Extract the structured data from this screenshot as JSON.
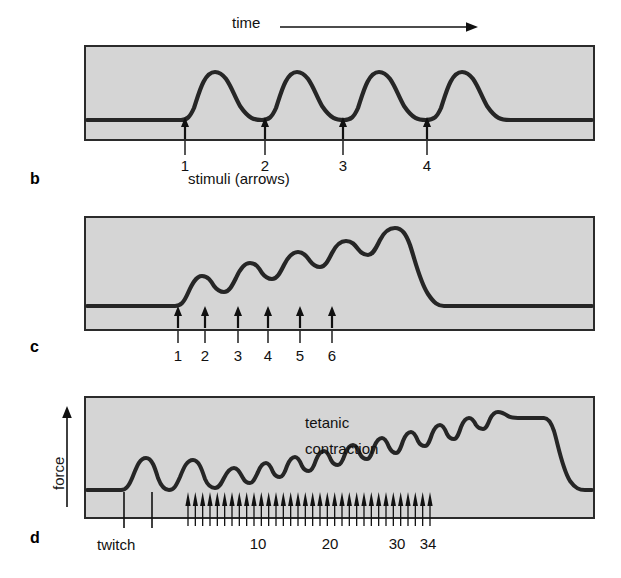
{
  "figure": {
    "title": "",
    "axis_time_label": "time",
    "axis_force_label": "force",
    "stimuli_caption": "stimuli (arrows)",
    "tetanic_label_line1": "tetanic",
    "tetanic_label_line2": "contraction",
    "twitch_label": "twitch",
    "panel_letters": {
      "b": "b",
      "c": "c",
      "d": "d"
    },
    "colors": {
      "panel_fill": "#d5d5d5",
      "panel_border": "#2b2b2b",
      "trace": "#262626",
      "text": "#111111",
      "background": "#ffffff"
    }
  },
  "chart_data": [
    {
      "type": "line",
      "panel": "b",
      "title": "Separate twitches — no summation",
      "xlabel": "time",
      "ylabel": "force",
      "grid": false,
      "legend": null,
      "stimulus_labels": [
        "1",
        "2",
        "3",
        "4"
      ],
      "stimulus_x": [
        185,
        265,
        343,
        427
      ],
      "stimulus_count": 4,
      "description": "Four equal-amplitude twitches; each returns to baseline before the next stimulus.",
      "x": [
        85,
        180,
        190,
        205,
        222,
        240,
        255,
        265,
        272,
        285,
        300,
        318,
        333,
        343,
        350,
        363,
        378,
        396,
        412,
        427,
        434,
        447,
        462,
        478,
        492,
        594
      ],
      "y": [
        0,
        0,
        10,
        38,
        55,
        55,
        30,
        0,
        10,
        38,
        55,
        55,
        30,
        0,
        10,
        38,
        55,
        55,
        30,
        0,
        10,
        38,
        55,
        50,
        0,
        0
      ],
      "ylim": [
        0,
        70
      ],
      "peak_amplitude": 55,
      "baseline": 0
    },
    {
      "type": "line",
      "panel": "c",
      "title": "Wave summation (incomplete tetanus)",
      "xlabel": "time",
      "ylabel": "force",
      "grid": false,
      "legend": null,
      "stimulus_labels": [
        "1",
        "2",
        "3",
        "4",
        "5",
        "6"
      ],
      "stimulus_x": [
        178,
        205,
        238,
        268,
        300,
        332
      ],
      "stimulus_count": 6,
      "description": "Six stimuli at increasing frequency; each contraction begins before full relaxation, so peaks climb in a staircase.",
      "peak_values": [
        30,
        40,
        50,
        58,
        66,
        78
      ],
      "trough_values": [
        22,
        33,
        43,
        52,
        60
      ],
      "ylim": [
        0,
        90
      ],
      "baseline": 0
    },
    {
      "type": "line",
      "panel": "d",
      "title": "Tetanic contraction",
      "xlabel": "stimulus number",
      "ylabel": "force",
      "grid": false,
      "legend": null,
      "tick_labels": [
        "10",
        "20",
        "30",
        "34"
      ],
      "tick_x": [
        258,
        330,
        397,
        428
      ],
      "twitch_marks_x": [
        124,
        152
      ],
      "stimulus_train_count": 34,
      "stimulus_train_x_start": 188,
      "stimulus_train_x_end": 430,
      "description": "Two isolated twitches, then a 34-pulse high-frequency train producing a rippling ramp that fuses into a smooth tetanic plateau before relaxation.",
      "plateau_value": 92,
      "twitch_peak_value": 26,
      "ylim": [
        0,
        100
      ],
      "baseline": 0
    }
  ]
}
